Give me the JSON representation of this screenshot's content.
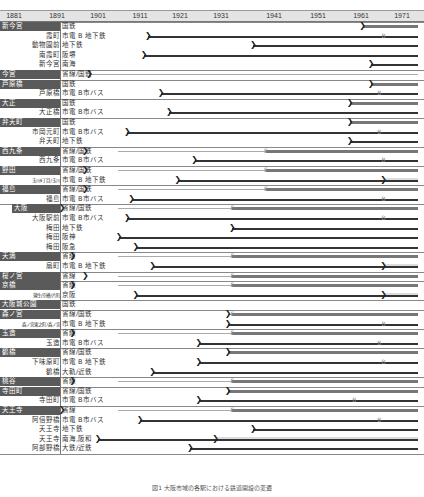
{
  "chart_data": {
    "type": "table",
    "title": "図1 大阪市域の各駅における鉄道開設の変遷",
    "xlabel": "",
    "x_ticks": [
      "1881",
      "1891",
      "1901",
      "1911",
      "1921",
      "1931",
      "1941",
      "1951",
      "1961",
      "1971"
    ],
    "xlim": [
      1881,
      1974
    ],
    "legend": {
      "B": "バス化/地下鉄化",
      "E": "電化",
      ")": "開業"
    },
    "groups": [
      {
        "group": "新今宮",
        "rows": [
          {
            "station": "",
            "type": "国鉄",
            "start": 1964,
            "style": "band"
          },
          {
            "station": "霞町",
            "type": "市電 B 地下鉄",
            "start": 1913,
            "change": 1969,
            "change_mark": "B",
            "style": "line"
          },
          {
            "station": "動物園前",
            "type": "地下鉄",
            "start": 1938,
            "style": "line"
          },
          {
            "station": "南霞町",
            "type": "阪堺",
            "start": 1912,
            "style": "line"
          },
          {
            "station": "新今宮",
            "type": "南海",
            "start": 1966,
            "style": "line"
          }
        ]
      },
      {
        "group": "今宮",
        "rows": [
          {
            "station": "",
            "type": "省線/国鉄",
            "start": 1899,
            "change": 1972,
            "change_mark": "E",
            "style": "thin"
          }
        ]
      },
      {
        "group": "芦原橋",
        "rows": [
          {
            "station": "",
            "type": "国鉄",
            "start": 1966,
            "style": "band"
          },
          {
            "station": "芦原橋",
            "type": "市電 B市バス",
            "start": 1916,
            "change": 1968,
            "change_mark": "B",
            "style": "line"
          }
        ]
      },
      {
        "group": "大正",
        "rows": [
          {
            "station": "",
            "type": "国鉄",
            "start": 1961,
            "style": "band"
          },
          {
            "station": "大正橋",
            "type": "市電 B市バス",
            "start": 1918,
            "style": "line"
          }
        ]
      },
      {
        "group": "弁天町",
        "rows": [
          {
            "station": "",
            "type": "国鉄",
            "start": 1961,
            "style": "band"
          },
          {
            "station": "市岡元町",
            "type": "市電 B市バス",
            "start": 1908,
            "change": 1968,
            "change_mark": "B",
            "style": "line"
          },
          {
            "station": "弁天町",
            "type": "地下鉄",
            "start": 1961,
            "style": "line"
          }
        ]
      },
      {
        "group": "西九条",
        "rows": [
          {
            "station": "",
            "type": "省線/国鉄",
            "start": 1898,
            "change": 1941,
            "change_mark": "E",
            "style": "band"
          },
          {
            "station": "西九条",
            "type": "市電 B市バス",
            "start": 1924,
            "change": 1969,
            "change_mark": "B",
            "style": "line"
          }
        ]
      },
      {
        "group": "野田",
        "rows": [
          {
            "station": "",
            "type": "省線/国鉄",
            "start": 1898,
            "change": 1941,
            "change_mark": "E",
            "style": "band"
          },
          {
            "station": "玉川4丁目/玉川",
            "type": "市電 B 地下鉄",
            "start": 1920,
            "change": 1969,
            "change_mark": ")",
            "style": "line"
          }
        ]
      },
      {
        "group": "福島",
        "rows": [
          {
            "station": "",
            "type": "省線/国鉄",
            "start": 1898,
            "change": 1941,
            "change_mark": "E",
            "style": "band"
          },
          {
            "station": "福島",
            "type": "市電 B市バス",
            "start": 1909,
            "change": 1969,
            "change_mark": "B",
            "style": "line"
          }
        ]
      },
      {
        "group": "大阪",
        "rows": [
          {
            "station": "",
            "type": "省線/国鉄",
            "start": 1881,
            "change": 1933,
            "change_mark": "E",
            "style": "band"
          },
          {
            "station": "大阪駅前",
            "type": "市電 B市バス",
            "start": 1908,
            "change": 1969,
            "change_mark": "B",
            "style": "line"
          },
          {
            "station": "梅田",
            "type": "地下鉄",
            "start": 1933,
            "style": "line"
          },
          {
            "station": "梅田",
            "type": "阪神",
            "start": 1906,
            "style": "line"
          },
          {
            "station": "梅田",
            "type": "阪急",
            "start": 1910,
            "style": "line"
          }
        ]
      },
      {
        "group": "天満",
        "rows": [
          {
            "station": "",
            "type": "省線",
            "start": 1895,
            "change": 1933,
            "change_mark": "E",
            "style": "band"
          },
          {
            "station": "扇町",
            "type": "市電 B 地下鉄",
            "start": 1914,
            "change": 1969,
            "change_mark": ")",
            "style": "line"
          }
        ]
      },
      {
        "group": "桜ノ宮",
        "rows": [
          {
            "station": "",
            "type": "省線",
            "start": 1898,
            "change": 1933,
            "change_mark": "E",
            "style": "band"
          }
        ]
      },
      {
        "group": "京橋",
        "rows": [
          {
            "station": "",
            "type": "省線",
            "start": 1895,
            "change": 1933,
            "change_mark": "E",
            "style": "band"
          },
          {
            "station": "蒲生/京橋/片町",
            "type": "京阪",
            "start": 1910,
            "change": 1969,
            "change_mark": ")",
            "style": "line"
          }
        ]
      },
      {
        "group": "大阪城公園",
        "rows": [
          {
            "station": "",
            "type": "国鉄",
            "start": 1983,
            "style": "none"
          }
        ]
      },
      {
        "group": "森ノ宮",
        "rows": [
          {
            "station": "",
            "type": "省線/国鉄",
            "start": 1932,
            "change": 1933,
            "change_mark": "E",
            "style": "band"
          },
          {
            "station": "森ノ宮東之町/森ノ宮",
            "type": "市電 B 地下鉄",
            "start": 1932,
            "change": 1969,
            "change_mark": "B",
            "style": "line"
          }
        ]
      },
      {
        "group": "玉造",
        "rows": [
          {
            "station": "",
            "type": "省線",
            "start": 1895,
            "change": 1933,
            "change_mark": "E",
            "style": "band"
          },
          {
            "station": "玉造",
            "type": "市電 B市バス",
            "start": 1925,
            "change": 1968,
            "change_mark": "B",
            "style": "line"
          }
        ]
      },
      {
        "group": "鶴橋",
        "rows": [
          {
            "station": "",
            "type": "省線/国鉄",
            "start": 1932,
            "style": "band"
          },
          {
            "station": "下味原町",
            "type": "市電 B 地下鉄",
            "start": 1925,
            "change": 1969,
            "change_mark": "B",
            "style": "line"
          },
          {
            "station": "鶴橋",
            "type": "大軌/近鉄",
            "start": 1914,
            "style": "line"
          }
        ]
      },
      {
        "group": "桃谷",
        "rows": [
          {
            "station": "",
            "type": "省線",
            "start": 1895,
            "change": 1933,
            "change_mark": "E",
            "style": "band"
          }
        ]
      },
      {
        "group": "寺田町",
        "rows": [
          {
            "station": "",
            "type": "省線/国鉄",
            "start": 1932,
            "style": "band"
          },
          {
            "station": "寺田町",
            "type": "市電 B市バス",
            "start": 1925,
            "change": 1962,
            "change_mark": "B",
            "style": "line"
          }
        ]
      },
      {
        "group": "天王寺",
        "rows": [
          {
            "station": "",
            "type": "省線",
            "start": 1889,
            "change": 1933,
            "change_mark": "E",
            "style": "band"
          },
          {
            "station": "阿倍野橋",
            "type": "市電 B市バス",
            "start": 1911,
            "change": 1968,
            "change_mark": "B",
            "style": "line"
          },
          {
            "station": "天王寺",
            "type": "地下鉄",
            "start": 1938,
            "style": "line"
          },
          {
            "station": "天王寺",
            "type": "南海,阪和",
            "start": 1901,
            "change": 1929,
            "change_mark": ")",
            "style": "line"
          },
          {
            "station": "阿部野橋",
            "type": "大鉄/近鉄",
            "start": 1923,
            "style": "line"
          }
        ]
      }
    ]
  },
  "axis": {
    "ticks": [
      {
        "label": "1881",
        "x": 14
      },
      {
        "label": "1891",
        "x": 57
      },
      {
        "label": "1901",
        "x": 98
      },
      {
        "label": "1911",
        "x": 140
      },
      {
        "label": "1921",
        "x": 180
      },
      {
        "label": "1931",
        "x": 221
      },
      {
        "label": "1941",
        "x": 274
      },
      {
        "label": "1951",
        "x": 318
      },
      {
        "label": "1961",
        "x": 361
      },
      {
        "label": "1971",
        "x": 402
      }
    ]
  },
  "caption": "図1 大阪市域の各駅における鉄道開設の変遷"
}
